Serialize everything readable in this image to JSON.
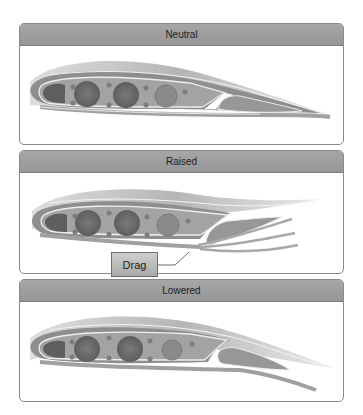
{
  "panels": [
    {
      "title": "Neutral",
      "state": "neutral"
    },
    {
      "title": "Raised",
      "state": "raised"
    },
    {
      "title": "Lowered",
      "state": "lowered"
    }
  ],
  "callout": {
    "label": "Drag"
  },
  "colors": {
    "header_bg": "#9e9e9e",
    "border": "#8a8a8a",
    "wing_skin": "#8f8f8f",
    "wing_body": "#9a9a9a",
    "spar_dark": "#6a6a6a",
    "airflow": "#b5b5b5"
  }
}
